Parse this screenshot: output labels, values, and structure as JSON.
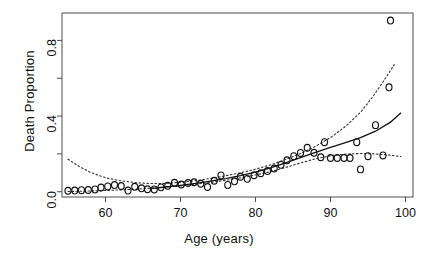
{
  "chart_data": {
    "type": "scatter",
    "title": "",
    "xlabel": "Age (years)",
    "ylabel": "Death Proportion",
    "xlim": [
      54.2,
      101.0
    ],
    "ylim": [
      -0.028,
      0.945
    ],
    "grid": false,
    "legend": null,
    "xticks": [
      60,
      70,
      80,
      90,
      100
    ],
    "xtick_labels": [
      "60",
      "70",
      "80",
      "90",
      "100"
    ],
    "yticks": [
      0.0,
      0.4,
      0.8
    ],
    "ytick_labels": [
      "0.0",
      "0.4",
      "0.8"
    ],
    "yticks_minor": [
      0.2,
      0.6
    ],
    "marker": "open-circle",
    "series": [
      {
        "name": "Observed death proportion",
        "style": "open circles",
        "points": [
          [
            55.0,
            0.005
          ],
          [
            55.9,
            0.006
          ],
          [
            56.8,
            0.008
          ],
          [
            57.7,
            0.009
          ],
          [
            58.6,
            0.012
          ],
          [
            59.4,
            0.022
          ],
          [
            60.3,
            0.028
          ],
          [
            61.2,
            0.035
          ],
          [
            62.1,
            0.03
          ],
          [
            63.0,
            0.006
          ],
          [
            63.9,
            0.026
          ],
          [
            64.8,
            0.018
          ],
          [
            65.6,
            0.013
          ],
          [
            66.5,
            0.012
          ],
          [
            67.4,
            0.023
          ],
          [
            68.3,
            0.031
          ],
          [
            69.2,
            0.047
          ],
          [
            70.1,
            0.038
          ],
          [
            71.0,
            0.046
          ],
          [
            71.8,
            0.05
          ],
          [
            72.7,
            0.042
          ],
          [
            73.6,
            0.025
          ],
          [
            74.5,
            0.058
          ],
          [
            75.4,
            0.086
          ],
          [
            76.3,
            0.036
          ],
          [
            77.2,
            0.055
          ],
          [
            78.0,
            0.079
          ],
          [
            78.9,
            0.068
          ],
          [
            79.8,
            0.087
          ],
          [
            80.7,
            0.098
          ],
          [
            81.6,
            0.109
          ],
          [
            82.5,
            0.123
          ],
          [
            83.4,
            0.142
          ],
          [
            84.2,
            0.166
          ],
          [
            85.1,
            0.188
          ],
          [
            86.0,
            0.205
          ],
          [
            86.9,
            0.232
          ],
          [
            87.8,
            0.206
          ],
          [
            88.7,
            0.182
          ],
          [
            89.2,
            0.262
          ],
          [
            90.0,
            0.178
          ],
          [
            90.9,
            0.178
          ],
          [
            91.8,
            0.178
          ],
          [
            92.6,
            0.178
          ],
          [
            93.5,
            0.262
          ],
          [
            94.0,
            0.118
          ],
          [
            95.0,
            0.188
          ],
          [
            96.0,
            0.352
          ],
          [
            97.0,
            0.192
          ],
          [
            97.8,
            0.552
          ],
          [
            98.0,
            0.905
          ]
        ]
      }
    ],
    "fit_curve": {
      "name": "Fitted model",
      "style": "solid line",
      "points": [
        [
          66.0,
          0.016
        ],
        [
          68.0,
          0.025
        ],
        [
          70.0,
          0.034
        ],
        [
          72.0,
          0.044
        ],
        [
          74.0,
          0.056
        ],
        [
          76.0,
          0.069
        ],
        [
          78.0,
          0.085
        ],
        [
          80.0,
          0.103
        ],
        [
          82.0,
          0.126
        ],
        [
          84.0,
          0.152
        ],
        [
          86.0,
          0.18
        ],
        [
          88.0,
          0.208
        ],
        [
          90.0,
          0.234
        ],
        [
          92.0,
          0.259
        ],
        [
          94.0,
          0.286
        ],
        [
          96.0,
          0.32
        ],
        [
          98.0,
          0.368
        ],
        [
          99.4,
          0.418
        ]
      ]
    },
    "confidence_bands": [
      {
        "name": "Upper confidence band",
        "style": "dotted line",
        "points": [
          [
            55.0,
            0.172
          ],
          [
            56.5,
            0.133
          ],
          [
            58.0,
            0.102
          ],
          [
            60.0,
            0.074
          ],
          [
            62.0,
            0.058
          ],
          [
            64.0,
            0.048
          ],
          [
            66.0,
            0.043
          ],
          [
            68.0,
            0.044
          ],
          [
            70.0,
            0.05
          ],
          [
            72.0,
            0.058
          ],
          [
            74.0,
            0.07
          ],
          [
            76.0,
            0.084
          ],
          [
            78.0,
            0.1
          ],
          [
            80.0,
            0.119
          ],
          [
            82.0,
            0.142
          ],
          [
            84.0,
            0.17
          ],
          [
            86.0,
            0.202
          ],
          [
            88.0,
            0.24
          ],
          [
            90.0,
            0.286
          ],
          [
            92.0,
            0.345
          ],
          [
            94.0,
            0.42
          ],
          [
            95.5,
            0.495
          ],
          [
            97.0,
            0.58
          ],
          [
            98.5,
            0.672
          ]
        ]
      },
      {
        "name": "Lower confidence band",
        "style": "dotted line",
        "points": [
          [
            55.0,
            0.001
          ],
          [
            58.0,
            0.004
          ],
          [
            61.0,
            0.008
          ],
          [
            64.0,
            0.013
          ],
          [
            67.0,
            0.021
          ],
          [
            70.0,
            0.031
          ],
          [
            73.0,
            0.044
          ],
          [
            76.0,
            0.06
          ],
          [
            79.0,
            0.08
          ],
          [
            82.0,
            0.106
          ],
          [
            84.0,
            0.128
          ],
          [
            86.0,
            0.152
          ],
          [
            88.0,
            0.174
          ],
          [
            90.0,
            0.19
          ],
          [
            92.0,
            0.199
          ],
          [
            94.0,
            0.202
          ],
          [
            96.0,
            0.2
          ],
          [
            98.0,
            0.193
          ],
          [
            99.4,
            0.186
          ]
        ]
      }
    ]
  }
}
